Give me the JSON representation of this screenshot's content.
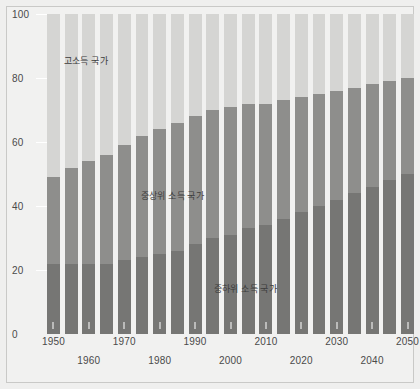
{
  "chart_data": {
    "type": "bar",
    "subtype": "stacked-100-percent",
    "title": "",
    "xlabel": "",
    "ylabel": "",
    "ylim": [
      0,
      100
    ],
    "yticks": [
      0,
      20,
      40,
      60,
      80,
      100
    ],
    "grid": true,
    "legend_position": "inline-annotations",
    "x": [
      1950,
      1955,
      1960,
      1965,
      1970,
      1975,
      1980,
      1985,
      1990,
      1995,
      2000,
      2005,
      2010,
      2015,
      2020,
      2025,
      2030,
      2035,
      2040,
      2045,
      2050
    ],
    "xtick_labels": [
      "1950",
      "1960",
      "1970",
      "1980",
      "1990",
      "2000",
      "2010",
      "2020",
      "2030",
      "2040",
      "2050"
    ],
    "xtick_values": [
      1950,
      1960,
      1970,
      1980,
      1990,
      2000,
      2010,
      2020,
      2030,
      2040,
      2050
    ],
    "series": [
      {
        "name": "중하위 소득 국가",
        "color": "#767674",
        "values": [
          22,
          22,
          22,
          22,
          23,
          24,
          25,
          26,
          28,
          30,
          31,
          33,
          34,
          36,
          38,
          40,
          42,
          44,
          46,
          48,
          50
        ]
      },
      {
        "name": "중상위 소득 국가",
        "color": "#8e8e8c",
        "values": [
          27,
          30,
          32,
          34,
          36,
          38,
          39,
          40,
          40,
          40,
          40,
          39,
          38,
          37,
          36,
          35,
          34,
          33,
          32,
          31,
          30
        ]
      },
      {
        "name": "고소득 국가",
        "color": "#d5d5d3",
        "values": [
          51,
          48,
          46,
          44,
          41,
          38,
          36,
          34,
          32,
          30,
          29,
          28,
          28,
          27,
          26,
          25,
          24,
          23,
          22,
          21,
          20
        ]
      }
    ],
    "annotations": [
      {
        "id": "high",
        "text": "고소득 국가"
      },
      {
        "id": "uppermid",
        "text": "중상위 소득 국가"
      },
      {
        "id": "lowermid",
        "text": "중하위 소득 국가"
      }
    ]
  },
  "colors": {
    "background": "#efefee",
    "plot_background": "#f1f1f0",
    "frame_border": "#c9c9c7",
    "gridline": "#ffffff",
    "tick_text": "#4a4a4a",
    "annotation_text": "#3c3c3c",
    "high_income": "#d5d5d3",
    "upper_middle_income": "#8e8e8c",
    "lower_middle_income": "#767674"
  }
}
